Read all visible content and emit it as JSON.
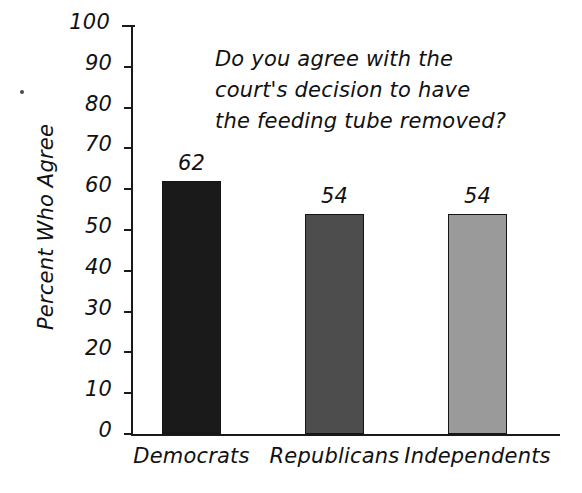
{
  "chart_data": {
    "type": "bar",
    "title": "Do you agree with the court's decision to have the feeding tube removed?",
    "title_lines": [
      "Do you agree with the",
      "court's decision to have",
      "the feeding tube removed?"
    ],
    "xlabel": "",
    "ylabel": "Percent Who Agree",
    "categories": [
      "Democrats",
      "Republicans",
      "Independents"
    ],
    "values": [
      62,
      54,
      54
    ],
    "value_labels": [
      "62",
      "54",
      "54"
    ],
    "bar_colors": [
      "#1a1a1a",
      "#4d4d4d",
      "#9a9a9a"
    ],
    "bar_border_color": "#141414",
    "ylim": [
      0,
      100
    ],
    "ytick_step": 10,
    "ytick_labels": [
      "100",
      "90",
      "80",
      "70",
      "60",
      "50",
      "40",
      "30",
      "20",
      "10",
      "0"
    ],
    "ytick_values": [
      100,
      90,
      80,
      70,
      60,
      50,
      40,
      30,
      20,
      10,
      0
    ],
    "grid": false,
    "legend": false,
    "legend_position": "none",
    "axis_color": "#1a1a1a",
    "background_color": "#ffffff",
    "text_color": "#111111"
  }
}
